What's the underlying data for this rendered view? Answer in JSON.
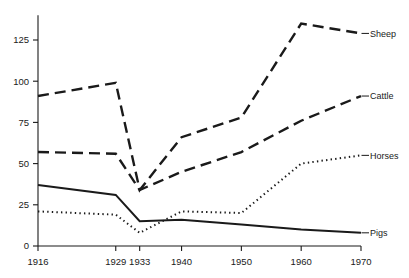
{
  "chart_data": {
    "type": "line",
    "title": "",
    "subtitle": "",
    "xlabel": "",
    "ylabel": "",
    "x": [
      1916,
      1929,
      1933,
      1940,
      1950,
      1960,
      1970
    ],
    "categories": [
      "1916",
      "1929",
      "1933",
      "1940",
      "1950",
      "1960",
      "1970"
    ],
    "xlim": [
      1916,
      1970
    ],
    "ylim": [
      0,
      140
    ],
    "yticks": [
      0,
      25,
      50,
      75,
      100,
      125
    ],
    "ytick_labels": [
      "0",
      "25",
      "50",
      "75",
      "100",
      "125"
    ],
    "xtick_labels": [
      "1916",
      "1929",
      "1933",
      "1940",
      "1950",
      "1960",
      "1970"
    ],
    "grid": false,
    "legend_position": "right-inline-labels",
    "series": [
      {
        "name": "Sheep",
        "label": "Sheep",
        "style": "long-dashed",
        "values": [
          91,
          99,
          34,
          66,
          78,
          135,
          129
        ]
      },
      {
        "name": "Cattle",
        "label": "Cattle",
        "style": "long-dashed",
        "values": [
          57,
          56,
          34,
          45,
          57,
          76,
          91
        ]
      },
      {
        "name": "Horses",
        "label": "Horses",
        "style": "dotted",
        "values": [
          21,
          19,
          8,
          21,
          20,
          50,
          55
        ]
      },
      {
        "name": "Pigs",
        "label": "Pigs",
        "style": "solid",
        "values": [
          37,
          31,
          15,
          16,
          13,
          10,
          8
        ]
      }
    ]
  },
  "axis": {
    "ytick_labels": [
      "0",
      "25",
      "50",
      "75",
      "100",
      "125"
    ],
    "xtick_labels": [
      "1916",
      "1929",
      "1933",
      "1940",
      "1950",
      "1960",
      "1970"
    ]
  },
  "series_labels": {
    "sheep": "Sheep",
    "cattle": "Cattle",
    "horses": "Horses",
    "pigs": "Pigs"
  },
  "colors": {
    "ink": "#1a1a1a",
    "background": "#ffffff"
  }
}
